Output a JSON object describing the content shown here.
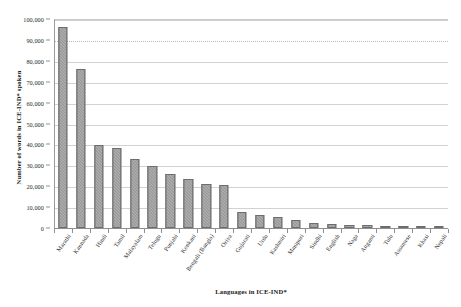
{
  "chart_data": {
    "type": "bar",
    "title": "",
    "xlabel": "Languages in ICE-IND*",
    "ylabel": "Number of words in ICE-IND* spoken",
    "ylim": [
      0,
      100000
    ],
    "ytick_labels": [
      "0",
      "10,000",
      "20,000",
      "30,000",
      "40,000",
      "50,000",
      "60,000",
      "70,000",
      "80,000",
      "90,000",
      "100,000"
    ],
    "ytick_values": [
      0,
      10000,
      20000,
      30000,
      40000,
      50000,
      60000,
      70000,
      80000,
      90000,
      100000
    ],
    "grid": true,
    "legend": "none",
    "bar_color": "#8c8c8c",
    "categories": [
      "Marathi",
      "Kannada",
      "Hindi",
      "Tamil",
      "Malayalam",
      "Telugu",
      "Punjabi",
      "Konkani",
      "Bengali (Bangla)",
      "Oriya",
      "Gujarati",
      "Urdu",
      "Kashmiri",
      "Manipuri",
      "Sindhi",
      "English",
      "Naga",
      "Angami",
      "Tulu",
      "Assamese",
      "Khasi",
      "Nepali"
    ],
    "values": [
      96000,
      76000,
      39500,
      38500,
      33000,
      29500,
      26000,
      23500,
      21000,
      20500,
      7500,
      6000,
      5500,
      4000,
      2500,
      2000,
      1500,
      1300,
      1000,
      900,
      700,
      500
    ]
  }
}
